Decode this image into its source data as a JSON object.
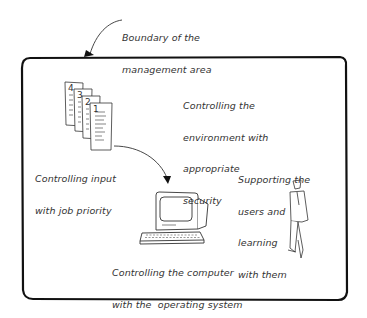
{
  "diagram": {
    "boundary_label": [
      "Boundary of the",
      "management area"
    ],
    "labels": {
      "security": [
        "Controlling the",
        "environment with",
        "appropriate",
        "security"
      ],
      "input": [
        "Controlling input",
        "with job priority"
      ],
      "users": [
        "Supporting the",
        "users and",
        "learning",
        "with them"
      ],
      "computer": [
        "Controlling the computer",
        "with the  operating system"
      ]
    },
    "job_numbers": [
      "4",
      "3",
      "2",
      "1"
    ],
    "icons": [
      "job-stack-icon",
      "computer-icon",
      "person-icon",
      "arrow-icon"
    ]
  }
}
